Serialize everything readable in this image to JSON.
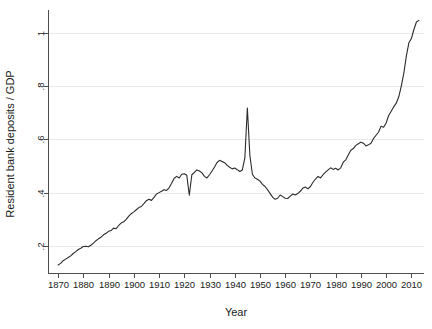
{
  "chart_data": {
    "type": "line",
    "title": "",
    "subtitle": "",
    "xlabel": "Year",
    "ylabel": "Resident bank deposits / GDP",
    "xlim": [
      1866,
      2015
    ],
    "ylim": [
      0.1,
      1.07
    ],
    "grid": true,
    "legend": null,
    "legend_position": "none",
    "xticks": [
      1870,
      1880,
      1890,
      1900,
      1910,
      1920,
      1930,
      1940,
      1950,
      1960,
      1970,
      1980,
      1990,
      2000,
      2010
    ],
    "xtick_labels": [
      "1870",
      "1880",
      "1890",
      "1900",
      "1910",
      "1920",
      "1930",
      "1940",
      "1950",
      "1960",
      "1970",
      "1980",
      "1990",
      "2000",
      "2010"
    ],
    "yticks": [
      0.2,
      0.4,
      0.6,
      0.8,
      1.0
    ],
    "ytick_labels": [
      ".2",
      ".4",
      ".6",
      ".8",
      "1"
    ],
    "series": [
      {
        "name": "Resident bank deposits / GDP",
        "color": "#2b2b2b",
        "x": [
          1870,
          1871,
          1872,
          1873,
          1874,
          1875,
          1876,
          1877,
          1878,
          1879,
          1880,
          1881,
          1882,
          1883,
          1884,
          1885,
          1886,
          1887,
          1888,
          1889,
          1890,
          1891,
          1892,
          1893,
          1894,
          1895,
          1896,
          1897,
          1898,
          1899,
          1900,
          1901,
          1902,
          1903,
          1904,
          1905,
          1906,
          1907,
          1908,
          1909,
          1910,
          1911,
          1912,
          1913,
          1914,
          1915,
          1916,
          1917,
          1918,
          1919,
          1920,
          1921,
          1922,
          1923,
          1924,
          1925,
          1926,
          1927,
          1928,
          1929,
          1930,
          1931,
          1932,
          1933,
          1934,
          1935,
          1936,
          1937,
          1938,
          1939,
          1940,
          1941,
          1942,
          1943,
          1944,
          1945,
          1946,
          1947,
          1948,
          1949,
          1950,
          1951,
          1952,
          1953,
          1954,
          1955,
          1956,
          1957,
          1958,
          1959,
          1960,
          1961,
          1962,
          1963,
          1964,
          1965,
          1966,
          1967,
          1968,
          1969,
          1970,
          1971,
          1972,
          1973,
          1974,
          1975,
          1976,
          1977,
          1978,
          1979,
          1980,
          1981,
          1982,
          1983,
          1984,
          1985,
          1986,
          1987,
          1988,
          1989,
          1990,
          1991,
          1992,
          1993,
          1994,
          1995,
          1996,
          1997,
          1998,
          1999,
          2000,
          2001,
          2002,
          2003,
          2004,
          2005,
          2006,
          2007,
          2008,
          2009,
          2010,
          2011,
          2012,
          2013
        ],
        "y": [
          0.13,
          0.136,
          0.146,
          0.152,
          0.158,
          0.164,
          0.173,
          0.18,
          0.188,
          0.193,
          0.199,
          0.2,
          0.198,
          0.204,
          0.212,
          0.221,
          0.228,
          0.234,
          0.243,
          0.249,
          0.256,
          0.259,
          0.268,
          0.266,
          0.278,
          0.287,
          0.292,
          0.301,
          0.313,
          0.322,
          0.329,
          0.337,
          0.345,
          0.349,
          0.36,
          0.371,
          0.376,
          0.372,
          0.383,
          0.396,
          0.401,
          0.406,
          0.412,
          0.409,
          0.419,
          0.436,
          0.455,
          0.462,
          0.456,
          0.47,
          0.472,
          0.466,
          0.391,
          0.468,
          0.477,
          0.486,
          0.482,
          0.475,
          0.462,
          0.456,
          0.468,
          0.482,
          0.497,
          0.514,
          0.522,
          0.518,
          0.513,
          0.503,
          0.496,
          0.49,
          0.493,
          0.487,
          0.48,
          0.486,
          0.53,
          0.718,
          0.54,
          0.47,
          0.456,
          0.451,
          0.444,
          0.432,
          0.424,
          0.412,
          0.398,
          0.384,
          0.376,
          0.38,
          0.392,
          0.386,
          0.38,
          0.379,
          0.388,
          0.396,
          0.392,
          0.398,
          0.406,
          0.418,
          0.422,
          0.415,
          0.424,
          0.44,
          0.452,
          0.462,
          0.456,
          0.468,
          0.478,
          0.486,
          0.494,
          0.488,
          0.492,
          0.486,
          0.494,
          0.515,
          0.524,
          0.542,
          0.56,
          0.566,
          0.578,
          0.584,
          0.59,
          0.586,
          0.576,
          0.58,
          0.586,
          0.604,
          0.616,
          0.628,
          0.65,
          0.646,
          0.662,
          0.69,
          0.706,
          0.722,
          0.736,
          0.76,
          0.8,
          0.848,
          0.912,
          0.962,
          0.978,
          1.012,
          1.04,
          1.046
        ]
      }
    ]
  },
  "layout": {
    "plot_left": 48,
    "plot_right": 424,
    "plot_top": 14,
    "plot_bottom": 273
  }
}
